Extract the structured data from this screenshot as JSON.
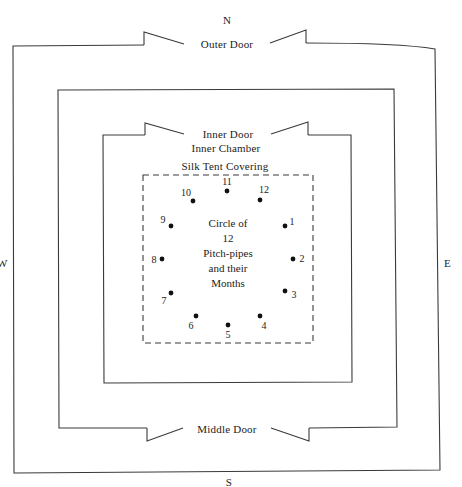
{
  "compass": {
    "north": "N",
    "south": "S",
    "west": "W",
    "east": "E"
  },
  "enclosures": {
    "outer": {
      "door_label": "Outer Door"
    },
    "middle": {
      "door_label": "Middle Door"
    },
    "inner": {
      "door_label": "Inner Door",
      "chamber_label": "Inner Chamber"
    },
    "tent": {
      "label": "Silk Tent Covering"
    }
  },
  "center_text": {
    "line1": "Circle of",
    "line2": "12",
    "line3": "Pitch-pipes",
    "line4": "and their",
    "line5": "Months"
  },
  "pitch_pipes": [
    {
      "n": "1",
      "x": 285,
      "y": 226,
      "lx": 292,
      "ly": 222
    },
    {
      "n": "2",
      "x": 293,
      "y": 259,
      "lx": 302,
      "ly": 259
    },
    {
      "n": "3",
      "x": 285,
      "y": 291,
      "lx": 294,
      "ly": 295
    },
    {
      "n": "4",
      "x": 260,
      "y": 316,
      "lx": 264,
      "ly": 326
    },
    {
      "n": "5",
      "x": 228,
      "y": 325,
      "lx": 228,
      "ly": 335
    },
    {
      "n": "6",
      "x": 196,
      "y": 316,
      "lx": 191,
      "ly": 326
    },
    {
      "n": "7",
      "x": 171,
      "y": 293,
      "lx": 164,
      "ly": 301
    },
    {
      "n": "8",
      "x": 162,
      "y": 259,
      "lx": 154,
      "ly": 260
    },
    {
      "n": "9",
      "x": 171,
      "y": 226,
      "lx": 163,
      "ly": 220
    },
    {
      "n": "10",
      "x": 193,
      "y": 201,
      "lx": 186,
      "ly": 193
    },
    {
      "n": "11",
      "x": 227,
      "y": 191,
      "lx": 227,
      "ly": 182
    },
    {
      "n": "12",
      "x": 260,
      "y": 200,
      "lx": 264,
      "ly": 190
    }
  ],
  "colors": {
    "line": "#3a3a3a",
    "dot": "#111111",
    "background": "#ffffff"
  }
}
